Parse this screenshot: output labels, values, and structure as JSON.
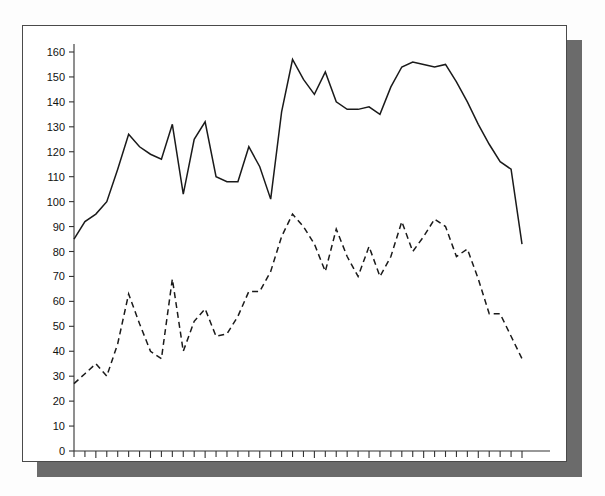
{
  "chart_data": {
    "type": "line",
    "title": "",
    "subtitle": "",
    "xlabel": "",
    "ylabel": "",
    "xlim": [
      1953,
      1994
    ],
    "ylim": [
      0,
      160
    ],
    "grid": false,
    "legend": "none",
    "x_tick_step": 1,
    "x_label_step": 5,
    "y_tick_step": 10,
    "x_tick_labels": [
      "1955",
      "1960",
      "1965",
      "1970",
      "1975",
      "1980",
      "1985",
      "1990",
      "1994"
    ],
    "x_tick_label_values": [
      1955,
      1960,
      1965,
      1970,
      1975,
      1980,
      1985,
      1990,
      1994
    ],
    "y_tick_labels": [
      "0",
      "10",
      "20",
      "30",
      "40",
      "50",
      "60",
      "70",
      "80",
      "90",
      "100",
      "110",
      "120",
      "130",
      "140",
      "150",
      "160"
    ],
    "y_tick_label_values": [
      0,
      10,
      20,
      30,
      40,
      50,
      60,
      70,
      80,
      90,
      100,
      110,
      120,
      130,
      140,
      150,
      160
    ],
    "x": [
      1953,
      1954,
      1955,
      1956,
      1957,
      1958,
      1959,
      1960,
      1961,
      1962,
      1963,
      1964,
      1965,
      1966,
      1967,
      1968,
      1969,
      1970,
      1971,
      1972,
      1973,
      1974,
      1975,
      1976,
      1977,
      1978,
      1979,
      1980,
      1981,
      1982,
      1983,
      1984,
      1985,
      1986,
      1987,
      1988,
      1989,
      1990,
      1991,
      1992,
      1993,
      1994
    ],
    "series": [
      {
        "name": "solid-series",
        "style": "solid",
        "color": "#1a1a1a",
        "values": [
          85,
          92,
          95,
          100,
          113,
          127,
          122,
          119,
          117,
          131,
          103,
          125,
          132,
          110,
          108,
          108,
          122,
          114,
          101,
          136,
          157,
          149,
          143,
          152,
          140,
          137,
          137,
          138,
          135,
          146,
          154,
          156,
          155,
          154,
          155,
          148,
          140,
          131,
          123,
          116,
          113,
          83
        ]
      },
      {
        "name": "dashed-series",
        "style": "dashed",
        "color": "#1a1a1a",
        "values": [
          27,
          31,
          35,
          30,
          43,
          63,
          51,
          40,
          37,
          69,
          40,
          52,
          57,
          46,
          47,
          54,
          64,
          64,
          72,
          86,
          95,
          90,
          83,
          72,
          89,
          78,
          70,
          82,
          70,
          78,
          92,
          80,
          86,
          93,
          90,
          78,
          81,
          69,
          55,
          55,
          46,
          37
        ]
      }
    ]
  }
}
